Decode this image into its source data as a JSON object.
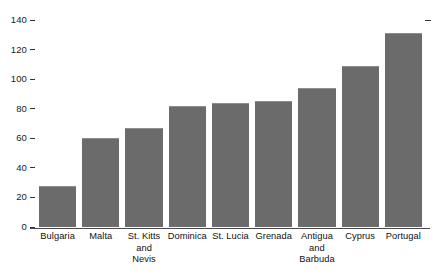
{
  "chart_data": {
    "type": "bar",
    "title": "",
    "subtitle": "",
    "xlabel": "",
    "ylabel": "",
    "categories": [
      "Bulgaria",
      "Malta",
      "St. Kitts and Nevis",
      "Dominica",
      "St. Lucia",
      "Grenada",
      "Antigua and Barbuda",
      "Cyprus",
      "Portugal"
    ],
    "category_lines": [
      [
        "Bulgaria"
      ],
      [
        "Malta"
      ],
      [
        "St. Kitts",
        "and",
        "Nevis"
      ],
      [
        "Dominica"
      ],
      [
        "St. Lucia"
      ],
      [
        "Grenada"
      ],
      [
        "Antigua",
        "and",
        "Barbuda"
      ],
      [
        "Cyprus"
      ],
      [
        "Portugal"
      ]
    ],
    "values": [
      28,
      60,
      67,
      82,
      84,
      85,
      94,
      109,
      131
    ],
    "ylim": [
      0,
      140
    ],
    "yticks": [
      0,
      20,
      40,
      60,
      80,
      100,
      120,
      140
    ],
    "ytick_labels": [
      "0",
      "20",
      "40",
      "60",
      "80",
      "100",
      "120",
      "140"
    ],
    "grid": false,
    "legend": null,
    "bar_color": "#6b6b6b",
    "bar_edge_color": "#8e8e8e",
    "axis_color": "#4a4a4a",
    "text_color": "#111111",
    "background": "#ffffff",
    "right_axis_tick_value": 140
  }
}
